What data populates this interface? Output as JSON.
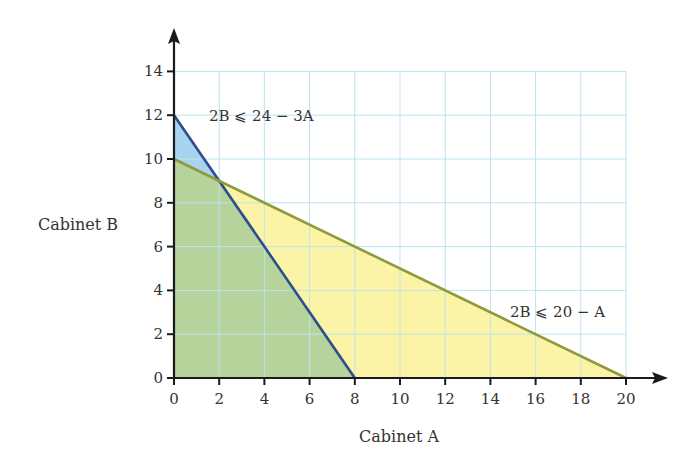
{
  "chart_data": {
    "type": "area",
    "title": "",
    "xlabel": "Cabinet A",
    "ylabel": "Cabinet B",
    "xlim": [
      0,
      20
    ],
    "ylim": [
      0,
      14
    ],
    "x_ticks": [
      0,
      2,
      4,
      6,
      8,
      10,
      12,
      14,
      16,
      18,
      20
    ],
    "y_ticks": [
      0,
      2,
      4,
      6,
      8,
      10,
      12,
      14
    ],
    "grid": true,
    "legend": null,
    "series": [
      {
        "name": "2B ≤ 24 − 3A",
        "type": "line",
        "points": [
          [
            0,
            12
          ],
          [
            8,
            0
          ]
        ],
        "color": "#2d4e8c",
        "fill_region": [
          [
            0,
            0
          ],
          [
            0,
            12
          ],
          [
            8,
            0
          ]
        ]
      },
      {
        "name": "2B ≤ 20 − A",
        "type": "line",
        "points": [
          [
            0,
            10
          ],
          [
            20,
            0
          ]
        ],
        "color": "#8f9a3a",
        "fill_region": [
          [
            0,
            0
          ],
          [
            0,
            10
          ],
          [
            20,
            0
          ]
        ]
      }
    ],
    "regions": [
      {
        "name": "feasible (both)",
        "polygon": [
          [
            0,
            0
          ],
          [
            0,
            10
          ],
          [
            2,
            9
          ],
          [
            8,
            0
          ]
        ],
        "color": "#b5d39a"
      },
      {
        "name": "only 2B ≤ 24 − 3A",
        "polygon": [
          [
            0,
            10
          ],
          [
            0,
            12
          ],
          [
            2,
            9
          ]
        ],
        "color": "#a9d4ef"
      },
      {
        "name": "only 2B ≤ 20 − A",
        "polygon": [
          [
            2,
            9
          ],
          [
            8,
            0
          ],
          [
            20,
            0
          ]
        ],
        "color": "#fbf4a6"
      }
    ],
    "intersection": [
      2,
      9
    ],
    "annotations": [
      {
        "text": "2B ⩽ 24 − 3A",
        "x": 1.6,
        "y": 12
      },
      {
        "text": "2B ⩽ 20 − A",
        "x": 14.9,
        "y": 3
      }
    ]
  },
  "labels": {
    "xlabel": "Cabinet A",
    "ylabel": "Cabinet B",
    "annot1": "2B ⩽ 24 − 3A",
    "annot2": "2B ⩽ 20 − A"
  },
  "colors": {
    "grid": "#bde3f0",
    "axis": "#1a1a1a",
    "blue_line": "#2d4e8c",
    "olive_line": "#8f9a3a",
    "blue_fill": "#a9d4ef",
    "green_fill": "#b5d39a",
    "yellow_fill": "#fbf4a6"
  }
}
